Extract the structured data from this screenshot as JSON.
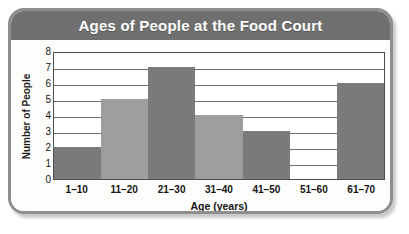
{
  "figure": {
    "title": "Ages of People at the Food Court",
    "frame_color": "#8e8e8e",
    "title_bar_color": "#6f6f6f",
    "title_text_color": "#ffffff"
  },
  "chart_data": {
    "type": "bar",
    "title": "Ages of People at the Food Court",
    "xlabel": "Age (years)",
    "ylabel": "Number of People",
    "categories": [
      "1–10",
      "11–20",
      "21–30",
      "31–40",
      "41–50",
      "51–60",
      "61–70"
    ],
    "values": [
      2,
      5,
      7,
      4,
      3,
      0,
      6
    ],
    "ylim": [
      0,
      8
    ],
    "ytick_labels": [
      "8",
      "7",
      "6",
      "5",
      "4",
      "3",
      "2",
      "1",
      "0"
    ],
    "ytick_values": [
      8,
      7,
      6,
      5,
      4,
      3,
      2,
      1,
      0
    ],
    "grid": true,
    "legend": false,
    "bar_gap": "none",
    "bar_colors": [
      "#7a7a7a",
      "#9e9e9e",
      "#7a7a7a",
      "#9e9e9e",
      "#7a7a7a",
      "#9e9e9e",
      "#7a7a7a"
    ]
  }
}
